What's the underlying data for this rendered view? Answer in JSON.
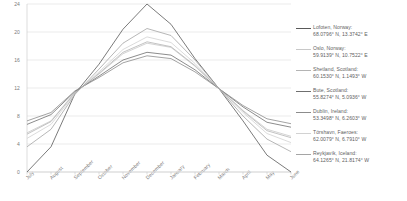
{
  "chart_data": {
    "type": "line",
    "title": "",
    "xlabel": "",
    "ylabel": "",
    "ylim": [
      0,
      24
    ],
    "yticks": [
      0,
      4,
      8,
      12,
      16,
      20,
      24
    ],
    "grid": true,
    "legend_position": "right",
    "categories": [
      "July",
      "August",
      "September",
      "October",
      "November",
      "December",
      "January",
      "February",
      "March",
      "April",
      "May",
      "June"
    ],
    "series": [
      {
        "name": "Lofoten, Norway",
        "coords": "68.0796° N, 13.3742° E",
        "color": "#595959",
        "values": [
          0,
          3.6,
          11.2,
          15.4,
          20.4,
          24,
          21.1,
          16.2,
          11.9,
          7.3,
          2.4,
          0
        ]
      },
      {
        "name": "Oslo, Norway",
        "coords": "59.9139° N, 10.7522° E",
        "color": "#c8c8c8",
        "values": [
          5.6,
          7.3,
          11.4,
          14.0,
          16.9,
          18.4,
          17.8,
          15.1,
          11.9,
          8.8,
          6.1,
          5.1
        ]
      },
      {
        "name": "Shetland, Scotland",
        "coords": "60.1530° N, 1.1493° W",
        "color": "#b4b4b4",
        "values": [
          5.4,
          7.2,
          11.3,
          14.1,
          17.1,
          18.6,
          17.9,
          15.2,
          11.9,
          8.7,
          5.9,
          4.9
        ]
      },
      {
        "name": "Bute, Scotland",
        "coords": "55.8274° N, 5.0936° W",
        "color": "#6f6f6f",
        "values": [
          6.8,
          8.2,
          11.5,
          13.7,
          16.0,
          17.1,
          16.7,
          14.6,
          11.9,
          9.3,
          7.1,
          6.4
        ]
      },
      {
        "name": "Dublin, Ireland",
        "coords": "53.3498° N, 6.2603° W",
        "color": "#8c8c8c",
        "values": [
          7.3,
          8.5,
          11.6,
          13.5,
          15.6,
          16.6,
          16.2,
          14.3,
          11.9,
          9.5,
          7.6,
          6.9
        ]
      },
      {
        "name": "Tórshavn, Faeroes",
        "coords": "62.0079° N, 6.7910° W",
        "color": "#d2d2d2",
        "values": [
          4.8,
          6.8,
          11.2,
          14.3,
          17.5,
          19.3,
          18.5,
          15.5,
          11.9,
          8.5,
          5.5,
          4.2
        ]
      },
      {
        "name": "Reykjavík, Iceland",
        "coords": "64.1265° N, 21.8174° W",
        "color": "#a5a5a5",
        "values": [
          3.6,
          6.1,
          11.1,
          14.7,
          18.4,
          20.5,
          19.5,
          16.0,
          11.9,
          8.0,
          4.7,
          2.9
        ]
      }
    ]
  },
  "axis": {
    "y_labels": [
      "24",
      "20",
      "16",
      "12",
      "8",
      "4",
      "0"
    ],
    "x_labels": [
      "July",
      "August",
      "September",
      "October",
      "November",
      "December",
      "January",
      "February",
      "March",
      "April",
      "May",
      "June"
    ]
  }
}
